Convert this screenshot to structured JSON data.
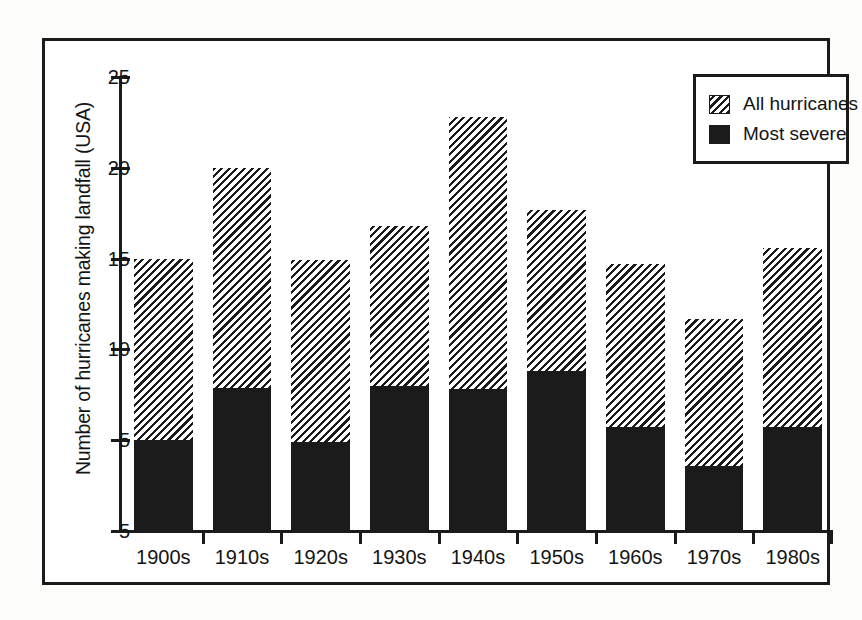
{
  "chart_data": {
    "type": "bar",
    "subtype": "stacked",
    "title": "",
    "xlabel": "",
    "ylabel": "Number of hurricanes making landfall (USA)",
    "categories": [
      "1900s",
      "1910s",
      "1920s",
      "1930s",
      "1940s",
      "1950s",
      "1960s",
      "1970s",
      "1980s"
    ],
    "series": [
      {
        "name": "Most severe",
        "fill": "solid",
        "color": "#1b1b1b",
        "values": [
          5.0,
          7.9,
          4.9,
          8.0,
          7.8,
          8.8,
          5.7,
          3.6,
          5.7
        ]
      },
      {
        "name": "All hurricanes",
        "fill": "hatched",
        "color": "#1b1b1b",
        "note": "Total bar height = all hurricanes; hatched portion is the remainder above 'Most severe'",
        "values": [
          15.0,
          20.0,
          14.9,
          16.8,
          22.8,
          17.7,
          14.7,
          11.7,
          15.6
        ]
      }
    ],
    "ylim": [
      0,
      25
    ],
    "yticks": [
      0,
      5,
      10,
      15,
      20,
      25
    ],
    "ytick_labels": [
      "5",
      "5",
      "10",
      "15",
      "20",
      "25"
    ],
    "grid": false,
    "legend_position": "top-right",
    "legend_entries": [
      "All hurricanes",
      "Most severe"
    ]
  },
  "legend": {
    "items": [
      {
        "label": "All hurricanes",
        "pattern": "hatch"
      },
      {
        "label": "Most severe",
        "pattern": "solid"
      }
    ]
  },
  "axes": {
    "y_title": "Number of hurricanes making landfall (USA)",
    "y_tick_labels": [
      "25",
      "20",
      "15",
      "10",
      "5",
      "5"
    ],
    "x_tick_labels": [
      "1900s",
      "1910s",
      "1920s",
      "1930s",
      "1940s",
      "1950s",
      "1960s",
      "1970s",
      "1980s"
    ]
  }
}
